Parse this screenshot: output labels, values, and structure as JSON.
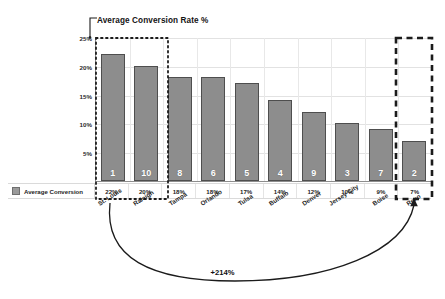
{
  "title": "Average Conversion Rate %",
  "legend": {
    "label": "Average Conversion",
    "swatch_color": "#9a9a9a"
  },
  "annotation": {
    "delta": "+214%"
  },
  "colors": {
    "bar_fill": "#8d8d8d",
    "bar_stroke": "#4e4e4e",
    "axis": "#8e8e8e",
    "gridline": "#e2e2e2",
    "highlight_box": "#1b1b1b"
  },
  "chart_data": {
    "type": "bar",
    "title": "Average Conversion Rate %",
    "xlabel": "",
    "ylabel": "",
    "ylim": [
      0,
      25
    ],
    "yticks": [
      "5%",
      "10%",
      "15%",
      "20%",
      "25%"
    ],
    "ytick_values": [
      5,
      10,
      15,
      20,
      25
    ],
    "grid": true,
    "legend_position": "bottom-left",
    "categories": [
      "St. Louis",
      "Raleigh",
      "Tampa",
      "Orlando",
      "Tulsa",
      "Buffalo",
      "Denver",
      "Jersey City",
      "Boise",
      "Reno"
    ],
    "values": [
      22,
      20,
      18,
      18,
      17,
      14,
      12,
      10,
      9,
      7
    ],
    "value_labels": [
      "22%",
      "20%",
      "18%",
      "18%",
      "17%",
      "14%",
      "12%",
      "10%",
      "9%",
      "7%"
    ],
    "rank_labels": [
      "1",
      "10",
      "8",
      "6",
      "5",
      "4",
      "9",
      "3",
      "7",
      "2"
    ],
    "annotations": [
      {
        "text": "+214%",
        "type": "curved-arrow",
        "from": "St. Louis",
        "to": "Reno"
      }
    ],
    "highlight_boxes": [
      {
        "style": "dotted",
        "categories": [
          "St. Louis",
          "Raleigh"
        ]
      },
      {
        "style": "dashed",
        "categories": [
          "Reno"
        ]
      }
    ]
  }
}
